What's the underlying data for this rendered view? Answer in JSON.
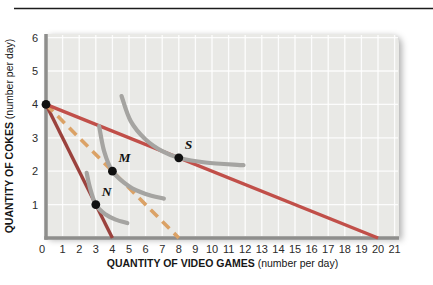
{
  "figure": {
    "width": 433,
    "height": 285,
    "top_rule_color": "#1c1c1c"
  },
  "chart_data": {
    "type": "line",
    "title": "",
    "xlabel": "QUANTITY OF VIDEO GAMES",
    "xlabel_note": "(number per day)",
    "ylabel": "QUANTITY OF COKES",
    "ylabel_note": "(number per day)",
    "xlim": [
      0,
      21.3
    ],
    "ylim": [
      0,
      6.05
    ],
    "xticks": [
      0,
      1,
      2,
      3,
      4,
      5,
      6,
      7,
      8,
      9,
      10,
      11,
      12,
      13,
      14,
      15,
      16,
      17,
      18,
      19,
      20,
      21
    ],
    "yticks": [
      0,
      1,
      2,
      3,
      4,
      5,
      6
    ],
    "grid": true,
    "legend": "none",
    "plot_bg": "#e9e9e6",
    "grid_color": "#ffffff",
    "axis_color": "#8e8e8c",
    "tick_color": "#2b2b2b",
    "label_color": "#161616",
    "point_color": "#101010",
    "budget_lines": [
      {
        "name": "budget-line-steep",
        "color": "#9b423d",
        "width": 3.4,
        "dash": "",
        "points": [
          [
            0,
            4
          ],
          [
            4,
            0
          ]
        ]
      },
      {
        "name": "budget-line-dashed",
        "color": "#dba266",
        "width": 3.6,
        "dash": "10 6.5",
        "points": [
          [
            0,
            4
          ],
          [
            8,
            0
          ]
        ]
      },
      {
        "name": "budget-line-flat",
        "color": "#c14f49",
        "width": 3.4,
        "dash": "",
        "points": [
          [
            0,
            4
          ],
          [
            20,
            0
          ]
        ]
      }
    ],
    "indifference_curves": [
      {
        "name": "indifference-curve-N",
        "color": "#a5a4a1",
        "width": 4.2,
        "points": [
          [
            2.45,
            1.95
          ],
          [
            2.65,
            1.5
          ],
          [
            3,
            1
          ],
          [
            3.55,
            0.72
          ],
          [
            4.2,
            0.55
          ],
          [
            4.9,
            0.45
          ]
        ]
      },
      {
        "name": "indifference-curve-M",
        "color": "#a5a4a1",
        "width": 4.2,
        "points": [
          [
            3.2,
            3.35
          ],
          [
            3.5,
            2.6
          ],
          [
            4,
            2
          ],
          [
            5,
            1.55
          ],
          [
            6,
            1.32
          ],
          [
            7.1,
            1.18
          ]
        ]
      },
      {
        "name": "indifference-curve-S",
        "color": "#a5a4a1",
        "width": 4.2,
        "points": [
          [
            4.55,
            4.25
          ],
          [
            5.1,
            3.5
          ],
          [
            6,
            2.95
          ],
          [
            7,
            2.6
          ],
          [
            8,
            2.4
          ],
          [
            9.6,
            2.26
          ],
          [
            11.9,
            2.18
          ]
        ]
      }
    ],
    "points": [
      {
        "label": "",
        "x": 0,
        "y": 4
      },
      {
        "label": "N",
        "x": 3,
        "y": 1
      },
      {
        "label": "M",
        "x": 4,
        "y": 2
      },
      {
        "label": "S",
        "x": 8,
        "y": 2.4
      }
    ]
  }
}
